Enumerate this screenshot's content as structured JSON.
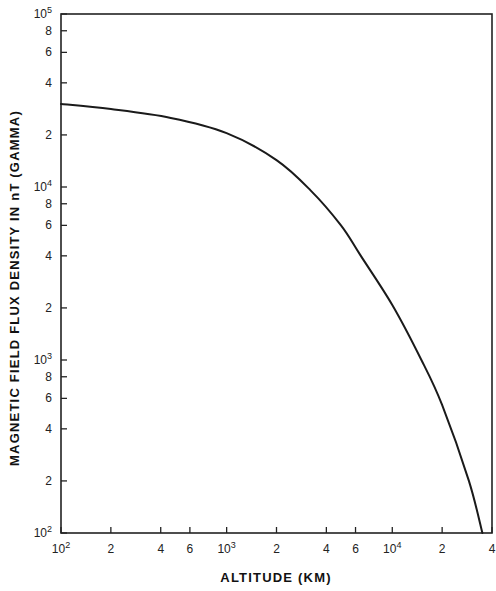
{
  "chart_data": {
    "type": "line",
    "title": "",
    "xlabel": "ALTITUDE (KM)",
    "ylabel": "MAGNETIC FIELD FLUX DENSITY IN nT (GAMMA)",
    "xscale": "log",
    "yscale": "log",
    "xlim": [
      100,
      40000
    ],
    "ylim": [
      100,
      100000
    ],
    "grid": false,
    "legend": null,
    "x_ticks": [
      {
        "value": 100,
        "label": "10^2"
      },
      {
        "value": 200,
        "label": "2"
      },
      {
        "value": 400,
        "label": "4"
      },
      {
        "value": 600,
        "label": "6"
      },
      {
        "value": 1000,
        "label": "10^3"
      },
      {
        "value": 2000,
        "label": "2"
      },
      {
        "value": 4000,
        "label": "4"
      },
      {
        "value": 6000,
        "label": "6"
      },
      {
        "value": 10000,
        "label": "10^4"
      },
      {
        "value": 20000,
        "label": "2"
      },
      {
        "value": 40000,
        "label": "4"
      }
    ],
    "y_ticks": [
      {
        "value": 100,
        "label": "10^2"
      },
      {
        "value": 200,
        "label": "2"
      },
      {
        "value": 400,
        "label": "4"
      },
      {
        "value": 600,
        "label": "6"
      },
      {
        "value": 800,
        "label": "8"
      },
      {
        "value": 1000,
        "label": "10^3"
      },
      {
        "value": 2000,
        "label": "2"
      },
      {
        "value": 4000,
        "label": "4"
      },
      {
        "value": 6000,
        "label": "6"
      },
      {
        "value": 8000,
        "label": "8"
      },
      {
        "value": 10000,
        "label": "10^4"
      },
      {
        "value": 20000,
        "label": "2"
      },
      {
        "value": 40000,
        "label": "4"
      },
      {
        "value": 60000,
        "label": "6"
      },
      {
        "value": 80000,
        "label": "8"
      },
      {
        "value": 100000,
        "label": "10^5"
      }
    ],
    "series": [
      {
        "name": "Magnetic field flux density vs altitude",
        "x": [
          100,
          200,
          460,
          1000,
          2000,
          3200,
          4900,
          6400,
          10000,
          15000,
          20000,
          29000,
          35000
        ],
        "y": [
          30200,
          28200,
          25100,
          20500,
          14300,
          9600,
          6000,
          4050,
          2080,
          1000,
          550,
          200,
          100
        ]
      }
    ]
  },
  "labels": {
    "xlabel": "ALTITUDE (KM)",
    "ylabel": "MAGNETIC FIELD FLUX DENSITY IN nT (GAMMA)"
  }
}
